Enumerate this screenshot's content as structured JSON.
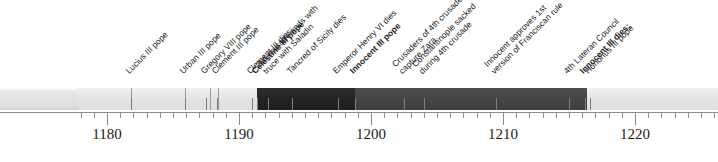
{
  "timeline": {
    "axis": {
      "year_min": 1177.8,
      "year_max": 1226.3,
      "pixels_per_year": 13.2,
      "origin_year": 1180,
      "origin_x": 107,
      "minor_tick_step": 1,
      "major_ticks": [
        {
          "year": 1180,
          "label": "1180"
        },
        {
          "year": 1190,
          "label": "1190"
        },
        {
          "year": 1200,
          "label": "1200"
        },
        {
          "year": 1210,
          "label": "1210"
        },
        {
          "year": 1220,
          "label": "1220"
        }
      ]
    },
    "bands": [
      {
        "name": "pre-celestine",
        "shade": "light",
        "start_year": 1177.8,
        "end_year": 1191.4
      },
      {
        "name": "celestine-iii",
        "shade": "dark",
        "start_year": 1191.4,
        "end_year": 1198.8
      },
      {
        "name": "innocent-iii",
        "shade": "mid",
        "start_year": 1198.8,
        "end_year": 1216.4
      },
      {
        "name": "honorius-iii",
        "shade": "light",
        "start_year": 1216.4,
        "end_year": 1226.3
      }
    ],
    "dividers": [
      {
        "name": "lucius-iii-start",
        "year": 1181.8
      },
      {
        "name": "urban-iii-start",
        "year": 1185.9
      },
      {
        "name": "gregory-viii-start",
        "year": 1187.8
      },
      {
        "name": "clement-iii-start",
        "year": 1188.4
      }
    ],
    "events": [
      {
        "name": "lucius-iii-pope",
        "year": 1181.8,
        "bold": false,
        "leader_height": 12,
        "lines": [
          "Lucius III pope"
        ]
      },
      {
        "name": "urban-iii-pope",
        "year": 1185.9,
        "bold": false,
        "leader_height": 12,
        "lines": [
          "Urban III pope"
        ]
      },
      {
        "name": "gregory-viii-pope",
        "year": 1187.5,
        "bold": false,
        "leader_height": 12,
        "lines": [
          "Gregory VIII pope"
        ]
      },
      {
        "name": "clement-iii-pope",
        "year": 1188.3,
        "bold": false,
        "leader_height": 12,
        "lines": [
          "Clement III pope"
        ]
      },
      {
        "name": "clement-iii-dies",
        "year": 1191.0,
        "bold": false,
        "leader_height": 12,
        "lines": [
          "Clement III dies;"
        ]
      },
      {
        "name": "celestine-iii-pope",
        "year": 1191.4,
        "bold": true,
        "leader_height": 12,
        "lines": [
          "Celestine III pope"
        ]
      },
      {
        "name": "third-crusade-truce",
        "year": 1192.2,
        "bold": false,
        "leader_height": 12,
        "lines": [
          "3rd crusade ends with",
          "truce with Saladin"
        ]
      },
      {
        "name": "tancred-of-sicily-dies",
        "year": 1194.0,
        "bold": false,
        "leader_height": 12,
        "lines": [
          "Tancred of Sicily dies"
        ]
      },
      {
        "name": "emperor-henry-vi-dies",
        "year": 1197.5,
        "bold": false,
        "leader_height": 12,
        "lines": [
          "Emperor Henry VI dies"
        ]
      },
      {
        "name": "innocent-iii-pope",
        "year": 1198.8,
        "bold": true,
        "leader_height": 12,
        "lines": [
          "Innocent III pope"
        ]
      },
      {
        "name": "crusaders-capture-zara",
        "year": 1202.5,
        "bold": false,
        "leader_height": 12,
        "lines": [
          "Crusaders of 4th crusade",
          "capture Zara"
        ]
      },
      {
        "name": "constantinople-sacked",
        "year": 1204.0,
        "bold": false,
        "leader_height": 12,
        "lines": [
          "Constantinople sacked",
          "during 4th crusade"
        ]
      },
      {
        "name": "franciscan-rule-approved",
        "year": 1209.5,
        "bold": false,
        "leader_height": 12,
        "lines": [
          "Innocent approves 1st",
          "version of Franciscan rule"
        ]
      },
      {
        "name": "fourth-lateran-council",
        "year": 1215.0,
        "bold": false,
        "leader_height": 12,
        "lines": [
          "4th Lateran Council"
        ]
      },
      {
        "name": "innocent-iii-dies",
        "year": 1216.2,
        "bold": true,
        "leader_height": 12,
        "lines": [
          "Innocent III dies;"
        ]
      },
      {
        "name": "honorius-iii-pope",
        "year": 1216.6,
        "bold": false,
        "leader_height": 12,
        "lines": [
          "Honorius III pope"
        ]
      }
    ]
  }
}
